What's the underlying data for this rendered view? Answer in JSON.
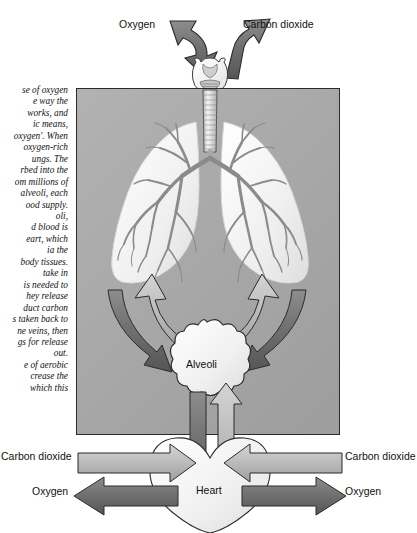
{
  "figure": {
    "panel_color": "#a9a9a9",
    "organ_fill": "#f2f2f2",
    "arrow_light": "#b9b9b9",
    "arrow_dark": "#6e6e6e",
    "outline": "#2b2b2b"
  },
  "body_text": {
    "paragraph": "se of oxygen\ne way the\n works, and\nic means,\noxygen'. When\n oxygen-rich\nungs. The\nrbed into the\nom millions of\nalveoli, each\nood supply.\noli,\nd blood is\neart, which\nia the\nbody tissues.\ntake in\nis needed to\nhey release\nduct carbon\ns taken back to\nne veins, then\ngs for release\n out.\ne of aerobic\ncrease the\nwhich this"
  },
  "labels": {
    "oxygen_top": "Oxygen",
    "carbon_dioxide_top": "Carbon dioxide",
    "carbon_dioxide_left": "Carbon dioxide",
    "carbon_dioxide_right": "Carbon dioxide",
    "oxygen_left": "Oxygen",
    "oxygen_right": "Oxygen",
    "alveoli": "Alveoli",
    "heart": "Heart"
  },
  "organs": {
    "larynx": "larynx",
    "trachea": "trachea",
    "left_lung": "left lung",
    "right_lung": "right lung",
    "bronchial_tree": "bronchial tree",
    "alveoli_sac": "alveoli sac",
    "heart_shape": "heart"
  }
}
